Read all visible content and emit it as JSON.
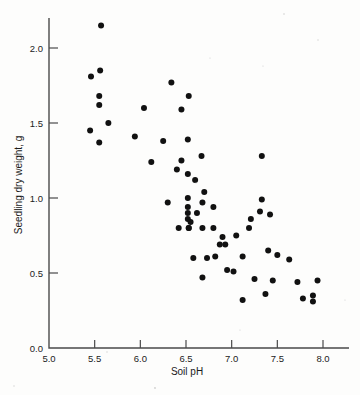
{
  "chart_data": {
    "type": "scatter",
    "title": "",
    "xlabel": "Soil pH",
    "ylabel": "Seedling dry weight, g",
    "xlim": [
      5.0,
      8.15
    ],
    "ylim": [
      0.0,
      2.25
    ],
    "xticks": [
      5.0,
      5.5,
      6.0,
      6.5,
      7.0,
      7.5,
      8.0
    ],
    "xticklabels": [
      "5.0",
      "5.5",
      "6.0",
      "6.5",
      "7.0",
      "7.5",
      "8.0"
    ],
    "yticks": [
      0.0,
      0.5,
      1.0,
      1.5,
      2.0
    ],
    "yticklabels": [
      "0.0",
      "0.5",
      "1.0",
      "1.5",
      "2.0"
    ],
    "grid": false,
    "legend": null,
    "marker": "filled-circle",
    "marker_color": "#111111",
    "marker_size": 3.0,
    "n_points": 65,
    "points": [
      {
        "x": 5.57,
        "y": 2.15
      },
      {
        "x": 5.56,
        "y": 1.85
      },
      {
        "x": 5.46,
        "y": 1.81
      },
      {
        "x": 5.55,
        "y": 1.68
      },
      {
        "x": 5.55,
        "y": 1.62
      },
      {
        "x": 5.65,
        "y": 1.5
      },
      {
        "x": 5.45,
        "y": 1.45
      },
      {
        "x": 5.55,
        "y": 1.37
      },
      {
        "x": 6.34,
        "y": 1.77
      },
      {
        "x": 6.53,
        "y": 1.68
      },
      {
        "x": 6.04,
        "y": 1.6
      },
      {
        "x": 6.45,
        "y": 1.59
      },
      {
        "x": 5.94,
        "y": 1.41
      },
      {
        "x": 6.52,
        "y": 1.39
      },
      {
        "x": 6.67,
        "y": 1.28
      },
      {
        "x": 7.33,
        "y": 1.28
      },
      {
        "x": 6.12,
        "y": 1.24
      },
      {
        "x": 6.4,
        "y": 1.19
      },
      {
        "x": 6.52,
        "y": 1.16
      },
      {
        "x": 6.7,
        "y": 1.04
      },
      {
        "x": 6.52,
        "y": 1.0
      },
      {
        "x": 7.33,
        "y": 0.99
      },
      {
        "x": 6.68,
        "y": 0.97
      },
      {
        "x": 6.52,
        "y": 0.94
      },
      {
        "x": 6.8,
        "y": 0.94
      },
      {
        "x": 6.52,
        "y": 0.9
      },
      {
        "x": 7.31,
        "y": 0.91
      },
      {
        "x": 7.42,
        "y": 0.89
      },
      {
        "x": 6.52,
        "y": 0.86
      },
      {
        "x": 7.21,
        "y": 0.86
      },
      {
        "x": 6.42,
        "y": 0.8
      },
      {
        "x": 6.53,
        "y": 0.8
      },
      {
        "x": 6.68,
        "y": 0.8
      },
      {
        "x": 6.8,
        "y": 0.8
      },
      {
        "x": 7.19,
        "y": 0.8
      },
      {
        "x": 6.9,
        "y": 0.74
      },
      {
        "x": 6.87,
        "y": 0.69
      },
      {
        "x": 6.93,
        "y": 0.69
      },
      {
        "x": 7.4,
        "y": 0.65
      },
      {
        "x": 6.58,
        "y": 0.6
      },
      {
        "x": 6.82,
        "y": 0.61
      },
      {
        "x": 7.12,
        "y": 0.61
      },
      {
        "x": 7.63,
        "y": 0.59
      },
      {
        "x": 7.02,
        "y": 0.51
      },
      {
        "x": 6.68,
        "y": 0.47
      },
      {
        "x": 7.25,
        "y": 0.46
      },
      {
        "x": 7.94,
        "y": 0.45
      },
      {
        "x": 7.72,
        "y": 0.44
      },
      {
        "x": 7.37,
        "y": 0.36
      },
      {
        "x": 7.89,
        "y": 0.35
      },
      {
        "x": 7.12,
        "y": 0.32
      },
      {
        "x": 7.89,
        "y": 0.31
      },
      {
        "x": 6.53,
        "y": 0.8
      },
      {
        "x": 6.73,
        "y": 0.6
      },
      {
        "x": 6.6,
        "y": 1.12
      },
      {
        "x": 6.25,
        "y": 1.38
      },
      {
        "x": 6.45,
        "y": 1.25
      },
      {
        "x": 6.55,
        "y": 0.84
      },
      {
        "x": 7.05,
        "y": 0.75
      },
      {
        "x": 6.3,
        "y": 0.97
      },
      {
        "x": 6.62,
        "y": 0.9
      },
      {
        "x": 7.5,
        "y": 0.62
      },
      {
        "x": 6.95,
        "y": 0.52
      },
      {
        "x": 7.45,
        "y": 0.45
      },
      {
        "x": 7.78,
        "y": 0.33
      }
    ]
  },
  "figure": {
    "background_color": "#fdfdfc",
    "axis_color": "#4a4a4a",
    "text_color": "#1a1a1a"
  }
}
